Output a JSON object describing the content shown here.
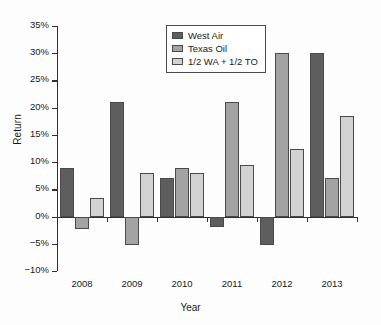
{
  "chart_data": {
    "type": "bar",
    "title": "",
    "xlabel": "Year",
    "ylabel": "Return",
    "categories": [
      "2008",
      "2009",
      "2010",
      "2011",
      "2012",
      "2013"
    ],
    "series": [
      {
        "name": "West Air",
        "values": [
          9,
          21,
          7,
          -2,
          -5.3,
          30
        ]
      },
      {
        "name": "Texas Oil",
        "values": [
          -2.2,
          -5.3,
          9,
          21,
          30,
          7
        ]
      },
      {
        "name": "1/2 WA + 1/2 TO",
        "values": [
          3.5,
          8,
          8,
          9.5,
          12.4,
          18.5
        ]
      }
    ],
    "ylim": [
      -10,
      35
    ],
    "ytick_values": [
      35,
      30,
      25,
      20,
      15,
      10,
      5,
      0,
      -5,
      -10
    ],
    "ytick_labels": [
      "35%",
      "30%",
      "25%",
      "20%",
      "15%",
      "10%",
      "5%",
      "0%",
      "−5%",
      "−10%"
    ],
    "grid": false,
    "legend_position": "top-center",
    "colors": {
      "series0": "#5e5e5e",
      "series1": "#a3a3a3",
      "series2": "#d2d2d2",
      "axis": "#303030",
      "text": "#1a1a1a",
      "background": "#fdfdfd"
    }
  }
}
